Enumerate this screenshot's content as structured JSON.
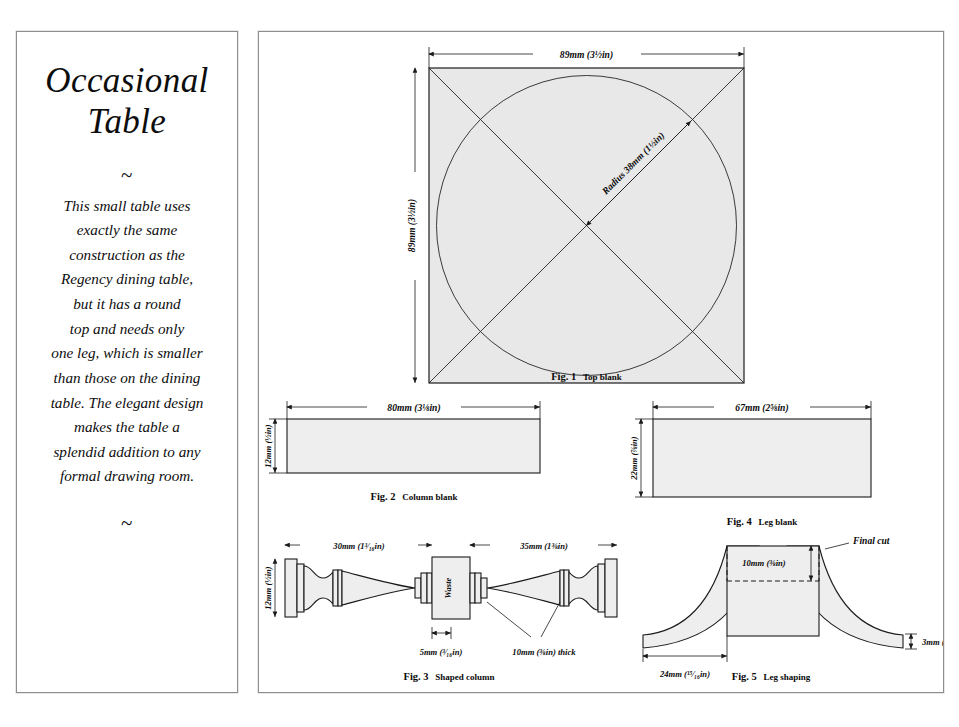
{
  "document": {
    "page_background": "#ffffff",
    "panel_border_color": "#8e8e8e",
    "part_fill": "#eeeeee",
    "ink_color": "#111111"
  },
  "left_panel": {
    "title_line1": "Occasional",
    "title_line2": "Table",
    "ornament_top": "~",
    "ornament_bottom": "~",
    "description_lines": [
      "This small table uses",
      "exactly the same",
      "construction as the",
      "Regency dining table,",
      "but it has a round",
      "top and needs only",
      "one leg, which is smaller",
      "than those on the dining",
      "table. The elegant design",
      "makes the table a",
      "splendid addition to any",
      "formal drawing room."
    ]
  },
  "figures": [
    {
      "id": "fig1",
      "caption_number": "Fig. 1",
      "caption_text": "Top blank",
      "shape": "square-with-inscribed-circle",
      "dimensions": {
        "width": "89mm (3½in)",
        "height": "89mm (3½in)",
        "radius": "Radius 38mm (1½in)"
      }
    },
    {
      "id": "fig2",
      "caption_number": "Fig. 2",
      "caption_text": "Column blank",
      "shape": "rectangle",
      "dimensions": {
        "length": "80mm (3⅛in)",
        "thickness": "12mm (½in)"
      }
    },
    {
      "id": "fig4",
      "caption_number": "Fig. 4",
      "caption_text": "Leg blank",
      "shape": "rectangle",
      "dimensions": {
        "length": "67mm (2⅝in)",
        "height": "22mm (⅞in)"
      }
    },
    {
      "id": "fig3",
      "caption_number": "Fig. 3",
      "caption_text": "Shaped column",
      "shape": "turned-column-pair-with-waste",
      "dimensions": {
        "left_section": "30mm (1³⁄₁₆in)",
        "right_section": "35mm (1⅜in)",
        "height": "12mm (½in)",
        "waste_width": "5mm (³⁄₁₆in)",
        "collar_thickness": "10mm (⅜in) thick"
      },
      "labels": {
        "waste": "Waste"
      }
    },
    {
      "id": "fig5",
      "caption_number": "Fig. 5",
      "caption_text": "Leg shaping",
      "shape": "cabriole-leg-profile",
      "dimensions": {
        "top_block_height": "10mm (⅜in)",
        "foot_thickness": "3mm (⅛in)",
        "base_width": "24mm (¹⁵⁄₁₆in)"
      },
      "labels": {
        "final_cut": "Final cut"
      }
    }
  ]
}
